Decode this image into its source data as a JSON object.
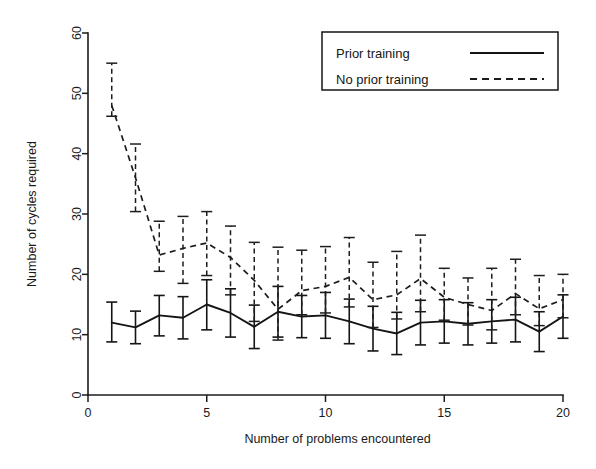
{
  "chart_data": {
    "type": "line",
    "title": "",
    "xlabel": "Number of problems encountered",
    "ylabel": "Number of cycles required",
    "xlim": [
      0,
      20
    ],
    "ylim": [
      0,
      60
    ],
    "xticks": [
      0,
      5,
      10,
      15,
      20
    ],
    "yticks": [
      0,
      10,
      20,
      30,
      40,
      50,
      60
    ],
    "grid": false,
    "legend_position": "top-right",
    "x": [
      1,
      2,
      3,
      4,
      5,
      6,
      7,
      8,
      9,
      10,
      11,
      12,
      13,
      14,
      15,
      16,
      17,
      18,
      19,
      20
    ],
    "series": [
      {
        "name": "Prior training",
        "style": "solid",
        "color": "#151515",
        "values": [
          12.0,
          11.2,
          13.2,
          12.8,
          15.0,
          13.6,
          11.3,
          13.8,
          13.0,
          13.2,
          12.2,
          11.0,
          10.2,
          12.0,
          12.2,
          11.8,
          12.2,
          12.5,
          10.5,
          13.0
        ],
        "err_low": [
          8.8,
          8.5,
          9.8,
          9.3,
          10.8,
          9.6,
          7.7,
          9.6,
          9.5,
          9.4,
          8.5,
          7.3,
          6.7,
          8.3,
          8.6,
          8.3,
          8.6,
          8.8,
          7.2,
          9.4
        ],
        "err_high": [
          15.4,
          13.9,
          16.5,
          16.3,
          19.1,
          17.6,
          14.9,
          18.0,
          16.5,
          17.0,
          15.9,
          14.7,
          13.7,
          15.7,
          15.8,
          15.3,
          15.8,
          16.2,
          13.8,
          16.6
        ]
      },
      {
        "name": "No prior training",
        "style": "dashed",
        "color": "#1d1d1d",
        "values": [
          48.0,
          36.0,
          23.2,
          24.3,
          25.2,
          22.8,
          19.0,
          14.2,
          17.3,
          18.0,
          19.5,
          15.8,
          16.6,
          19.3,
          16.2,
          15.0,
          14.0,
          16.8,
          14.3,
          15.8
        ],
        "err_low": [
          46.2,
          30.4,
          20.5,
          18.5,
          19.8,
          16.6,
          12.2,
          9.1,
          13.3,
          13.6,
          14.6,
          11.2,
          12.6,
          13.8,
          12.4,
          11.6,
          10.8,
          13.3,
          11.5,
          12.8
        ],
        "err_high": [
          55.0,
          41.6,
          28.8,
          29.6,
          30.4,
          28.0,
          25.3,
          24.5,
          24.0,
          24.6,
          26.1,
          22.0,
          23.8,
          26.5,
          21.0,
          19.4,
          21.0,
          22.5,
          19.8,
          20.0
        ]
      }
    ]
  },
  "legend": {
    "items": [
      {
        "label": "Prior training",
        "style": "solid"
      },
      {
        "label": "No prior training",
        "style": "dashed"
      }
    ]
  },
  "axes": {
    "y_label": "Number of cycles required",
    "x_label": "Number of problems encountered",
    "x_tick_labels": [
      "0",
      "5",
      "10",
      "15",
      "20"
    ],
    "y_tick_labels": [
      "0",
      "10",
      "20",
      "30",
      "40",
      "50",
      "60"
    ]
  }
}
